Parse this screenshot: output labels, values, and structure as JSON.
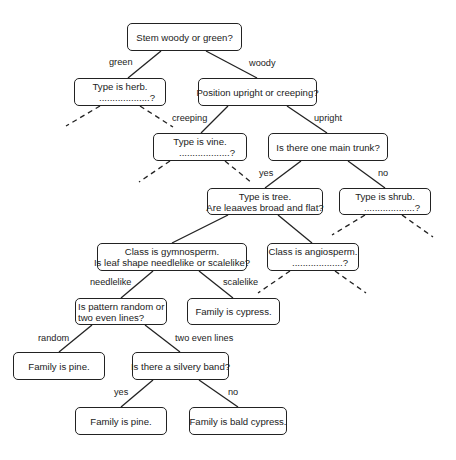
{
  "diagram": {
    "type": "decision-tree",
    "nodes": {
      "root": {
        "lines": [
          "Stem woody or green?",
          ""
        ]
      },
      "herb": {
        "lines": [
          "Type is herb.",
          "...................?"
        ]
      },
      "position": {
        "lines": [
          "Position upright or creeping?",
          ""
        ]
      },
      "vine": {
        "lines": [
          "Type is vine.",
          "...................?"
        ]
      },
      "trunk": {
        "lines": [
          "Is there one main trunk?",
          ""
        ]
      },
      "tree": {
        "lines": [
          "Type is tree.",
          "Are leaaves broad and flat?"
        ]
      },
      "shrub": {
        "lines": [
          "Type is shrub.",
          "...................?"
        ]
      },
      "gymnosperm": {
        "lines": [
          "Class is gymnosperm.",
          "Is leaf shape needlelike or scalelike?"
        ]
      },
      "angiosperm": {
        "lines": [
          "Class is angiosperm.",
          "...................?"
        ]
      },
      "pattern": {
        "lines": [
          "Is pattern random or",
          "two even lines?"
        ]
      },
      "cypress": {
        "lines": [
          "Family is cypress.",
          ""
        ]
      },
      "pine1": {
        "lines": [
          "Family is pine.",
          ""
        ]
      },
      "silvery": {
        "lines": [
          "Is there a silvery band?",
          ""
        ]
      },
      "pine2": {
        "lines": [
          "Family is pine.",
          ""
        ]
      },
      "baldcypress": {
        "lines": [
          "Family is bald cypress.",
          ""
        ]
      }
    },
    "edge_labels": {
      "green": "green",
      "woody": "woody",
      "creeping": "creeping",
      "upright": "upright",
      "yes_trunk": "yes",
      "no_trunk": "no",
      "needlelike": "needlelike",
      "scalelike": "scalelike",
      "random": "random",
      "two_even_lines": "two even lines",
      "yes_silvery": "yes",
      "no_silvery": "no"
    },
    "colors": {
      "line": "#222222",
      "background": "#ffffff"
    }
  }
}
